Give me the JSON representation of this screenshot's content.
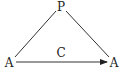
{
  "diagram": {
    "nodes": [
      {
        "id": "top",
        "label": "P",
        "x": 61,
        "y": 10
      },
      {
        "id": "left",
        "label": "A",
        "x": 9,
        "y": 66
      },
      {
        "id": "right",
        "label": "A",
        "x": 114,
        "y": 66
      }
    ],
    "edge_label": "C",
    "edges": [
      {
        "from": "top",
        "to": "left",
        "arrow": false
      },
      {
        "from": "top",
        "to": "right",
        "arrow": false
      },
      {
        "from": "left",
        "to": "right",
        "arrow": true,
        "label": "C"
      }
    ]
  }
}
